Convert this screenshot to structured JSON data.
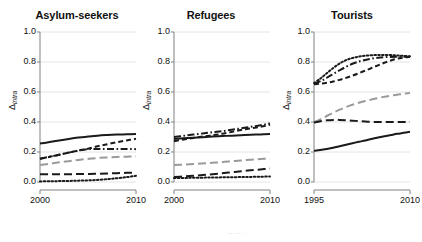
{
  "figure": {
    "ylabel_symbol": "Δ",
    "ylabel_subscript": "intra",
    "caption_partial": "—  —    · ·  ·"
  },
  "chart_data": {
    "type": "line",
    "title": "",
    "xlabel": "",
    "ylabel": "Δintra",
    "ylim": [
      0.0,
      1.0
    ],
    "yticks": [
      0.0,
      0.2,
      0.4,
      0.6,
      0.8,
      1.0
    ],
    "ytick_labels": [
      "0.0",
      "0.2",
      "0.4",
      "0.6",
      "0.8",
      "1.0"
    ],
    "grid": "horizontal",
    "legend": "none",
    "panels": [
      {
        "name": "panel-asylum-seekers",
        "title": "Asylum-seekers",
        "xlim": [
          2000,
          2010
        ],
        "xticks": [
          2000,
          2010
        ],
        "xtick_labels": [
          "2000",
          "2010"
        ],
        "x": [
          2000,
          2001,
          2002,
          2003,
          2004,
          2005,
          2006,
          2007,
          2008,
          2009,
          2010
        ],
        "series": [
          {
            "name": "solid-black",
            "style": "solid",
            "color": "#1a1a1a",
            "width": 2.0,
            "values": [
              0.256,
              0.266,
              0.277,
              0.287,
              0.296,
              0.303,
              0.309,
              0.313,
              0.316,
              0.318,
              0.32
            ]
          },
          {
            "name": "dashed-black",
            "style": "dashed",
            "color": "#1a1a1a",
            "width": 2.0,
            "values": [
              0.155,
              0.168,
              0.182,
              0.196,
              0.21,
              0.222,
              0.238,
              0.252,
              0.265,
              0.277,
              0.288
            ]
          },
          {
            "name": "dashdot-black",
            "style": "dashdot",
            "color": "#1a1a1a",
            "width": 2.0,
            "values": [
              0.155,
              0.168,
              0.182,
              0.196,
              0.21,
              0.219,
              0.22,
              0.22,
              0.22,
              0.22,
              0.219
            ]
          },
          {
            "name": "gray-longdash",
            "style": "longdash",
            "color": "#9a9a9a",
            "width": 2.0,
            "values": [
              0.113,
              0.122,
              0.131,
              0.139,
              0.147,
              0.154,
              0.16,
              0.164,
              0.167,
              0.169,
              0.17
            ]
          },
          {
            "name": "black-longdash",
            "style": "longdash",
            "color": "#1a1a1a",
            "width": 2.0,
            "values": [
              0.052,
              0.052,
              0.052,
              0.052,
              0.053,
              0.053,
              0.055,
              0.057,
              0.059,
              0.061,
              0.062
            ]
          },
          {
            "name": "dotted-black",
            "style": "dotted",
            "color": "#1a1a1a",
            "width": 2.0,
            "values": [
              0.004,
              0.005,
              0.006,
              0.007,
              0.009,
              0.011,
              0.014,
              0.019,
              0.025,
              0.032,
              0.041
            ]
          }
        ]
      },
      {
        "name": "panel-refugees",
        "title": "Refugees",
        "xlim": [
          2000,
          2010
        ],
        "xticks": [
          2000,
          2010
        ],
        "xtick_labels": [
          "2000",
          "2010"
        ],
        "x": [
          2000,
          2001,
          2002,
          2003,
          2004,
          2005,
          2006,
          2007,
          2008,
          2009,
          2010
        ],
        "series": [
          {
            "name": "dashdot-black",
            "style": "dashdot",
            "color": "#1a1a1a",
            "width": 2.0,
            "values": [
              0.3,
              0.308,
              0.316,
              0.324,
              0.332,
              0.339,
              0.348,
              0.358,
              0.368,
              0.378,
              0.39
            ]
          },
          {
            "name": "dashed-black",
            "style": "dashed",
            "color": "#1a1a1a",
            "width": 2.0,
            "values": [
              0.272,
              0.283,
              0.293,
              0.303,
              0.312,
              0.321,
              0.334,
              0.347,
              0.358,
              0.368,
              0.382
            ]
          },
          {
            "name": "solid-black",
            "style": "solid",
            "color": "#1a1a1a",
            "width": 2.0,
            "values": [
              0.287,
              0.291,
              0.295,
              0.299,
              0.303,
              0.306,
              0.309,
              0.312,
              0.315,
              0.317,
              0.32
            ]
          },
          {
            "name": "gray-longdash",
            "style": "longdash",
            "color": "#9a9a9a",
            "width": 2.0,
            "values": [
              0.113,
              0.116,
              0.12,
              0.124,
              0.128,
              0.132,
              0.138,
              0.144,
              0.149,
              0.153,
              0.157
            ]
          },
          {
            "name": "black-longdash",
            "style": "longdash",
            "color": "#1a1a1a",
            "width": 2.0,
            "values": [
              0.034,
              0.037,
              0.041,
              0.046,
              0.052,
              0.058,
              0.065,
              0.072,
              0.078,
              0.084,
              0.09
            ]
          },
          {
            "name": "dotted-black",
            "style": "dotted",
            "color": "#1a1a1a",
            "width": 2.0,
            "values": [
              0.026,
              0.027,
              0.028,
              0.029,
              0.03,
              0.031,
              0.032,
              0.033,
              0.034,
              0.035,
              0.037
            ]
          }
        ]
      },
      {
        "name": "panel-tourists",
        "title": "Tourists",
        "xlim": [
          1995,
          2010
        ],
        "xticks": [
          1995,
          2010
        ],
        "xtick_labels": [
          "1995",
          "2010"
        ],
        "x": [
          1995,
          1996,
          1997,
          1998,
          1999,
          2000,
          2001,
          2002,
          2003,
          2004,
          2005,
          2006,
          2007,
          2008,
          2009,
          2010
        ],
        "series": [
          {
            "name": "dotted-black",
            "style": "dotted",
            "color": "#1a1a1a",
            "width": 2.0,
            "values": [
              0.66,
              0.69,
              0.725,
              0.76,
              0.79,
              0.812,
              0.827,
              0.836,
              0.842,
              0.845,
              0.847,
              0.847,
              0.846,
              0.844,
              0.841,
              0.838
            ]
          },
          {
            "name": "dashdot-black",
            "style": "dashdot",
            "color": "#1a1a1a",
            "width": 2.0,
            "values": [
              0.655,
              0.672,
              0.695,
              0.72,
              0.745,
              0.768,
              0.788,
              0.803,
              0.814,
              0.822,
              0.828,
              0.832,
              0.834,
              0.835,
              0.835,
              0.834
            ]
          },
          {
            "name": "dashed-black",
            "style": "dashed",
            "color": "#1a1a1a",
            "width": 2.0,
            "values": [
              0.652,
              0.655,
              0.661,
              0.67,
              0.681,
              0.694,
              0.709,
              0.725,
              0.742,
              0.76,
              0.778,
              0.795,
              0.81,
              0.822,
              0.83,
              0.835
            ]
          },
          {
            "name": "gray-longdash",
            "style": "longdash",
            "color": "#9a9a9a",
            "width": 2.0,
            "values": [
              0.398,
              0.418,
              0.44,
              0.462,
              0.482,
              0.5,
              0.515,
              0.528,
              0.54,
              0.55,
              0.56,
              0.568,
              0.575,
              0.582,
              0.588,
              0.594
            ]
          },
          {
            "name": "black-longdash",
            "style": "longdash",
            "color": "#1a1a1a",
            "width": 2.0,
            "values": [
              0.396,
              0.405,
              0.411,
              0.414,
              0.414,
              0.412,
              0.409,
              0.406,
              0.403,
              0.401,
              0.4,
              0.4,
              0.4,
              0.4,
              0.4,
              0.4
            ]
          },
          {
            "name": "solid-black",
            "style": "solid",
            "color": "#1a1a1a",
            "width": 2.0,
            "values": [
              0.208,
              0.213,
              0.22,
              0.228,
              0.238,
              0.248,
              0.258,
              0.268,
              0.277,
              0.287,
              0.296,
              0.305,
              0.313,
              0.321,
              0.328,
              0.335
            ]
          }
        ]
      }
    ]
  }
}
